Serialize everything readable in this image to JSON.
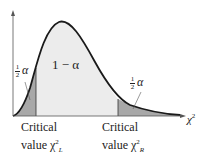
{
  "diagram": {
    "type": "chi-square distribution with two-tailed critical regions",
    "x_axis_label": "χ",
    "x_axis_label_sup": "2",
    "center_region_label": "1 − α",
    "left_tail_label": {
      "num": "1",
      "den": "2",
      "symbol": "α"
    },
    "right_tail_label": {
      "num": "1",
      "den": "2",
      "symbol": "α"
    },
    "left_critical": {
      "line1": "Critical",
      "line2": "value χ",
      "sup": "2",
      "sub": "L"
    },
    "right_critical": {
      "line1": "Critical",
      "line2": "value χ",
      "sup": "2",
      "sub": "R"
    },
    "colors": {
      "curve": "#1a1a1a",
      "center_fill": "#ececec",
      "tail_fill": "#a8a8a8",
      "axis": "#555555"
    }
  }
}
